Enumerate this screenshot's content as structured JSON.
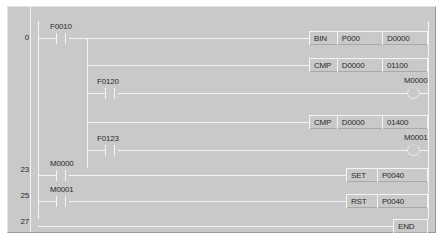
{
  "editor": {
    "title": "ladder-logic-program",
    "colors": {
      "background": "#c9c9c9",
      "wire": "#f4f4f4",
      "text": "#2b2b2b",
      "border_light": "#e4e4e4",
      "border_dark": "#9a9a9a"
    }
  },
  "step_numbers": [
    {
      "value": "0",
      "top": 26
    },
    {
      "value": "23",
      "top": 158
    },
    {
      "value": "25",
      "top": 184
    },
    {
      "value": "27",
      "top": 210
    }
  ],
  "rungs": [
    {
      "step": "0",
      "contact": {
        "label": "F0010",
        "type": "normally-open-contact"
      },
      "outputs": [
        {
          "op": "BIN",
          "arg1": "P000",
          "arg2": "D0000"
        },
        {
          "op": "CMP",
          "arg1": "D0000",
          "arg2": "01100"
        }
      ],
      "coil": {
        "label": "M0000",
        "type": "output-coil"
      }
    },
    {
      "step": "",
      "contact": {
        "label": "F0120",
        "type": "normally-open-contact"
      },
      "outputs": [],
      "coil": null
    },
    {
      "step": "",
      "contact": {
        "label": "F0123",
        "type": "normally-open-contact"
      },
      "outputs": [
        {
          "op": "CMP",
          "arg1": "D0000",
          "arg2": "01400"
        }
      ],
      "coil": {
        "label": "M0001",
        "type": "output-coil"
      }
    },
    {
      "step": "23",
      "contact": {
        "label": "M0000",
        "type": "normally-open-contact"
      },
      "outputs": [
        {
          "op": "SET",
          "arg1": "P0040",
          "arg2": ""
        }
      ],
      "coil": null
    },
    {
      "step": "25",
      "contact": {
        "label": "M0001",
        "type": "normally-open-contact"
      },
      "outputs": [
        {
          "op": "RST",
          "arg1": "P0040",
          "arg2": ""
        }
      ],
      "coil": null
    },
    {
      "step": "27",
      "contact": null,
      "outputs": [
        {
          "op": "END",
          "arg1": "",
          "arg2": ""
        }
      ],
      "coil": null
    }
  ],
  "instructions": {
    "bin_op": "BIN",
    "bin_arg1": "P000",
    "bin_arg2": "D0000",
    "cmp1_op": "CMP",
    "cmp1_arg1": "D0000",
    "cmp1_arg2": "01100",
    "cmp2_op": "CMP",
    "cmp2_arg1": "D0000",
    "cmp2_arg2": "01400",
    "set_op": "SET",
    "set_arg1": "P0040",
    "rst_op": "RST",
    "rst_arg1": "P0040",
    "end_op": "END"
  },
  "contacts": {
    "c1": "F0010",
    "c2": "F0120",
    "c3": "F0123",
    "c4": "M0000",
    "c5": "M0001"
  },
  "coils": {
    "coil1": "M0000",
    "coil2": "M0001"
  }
}
